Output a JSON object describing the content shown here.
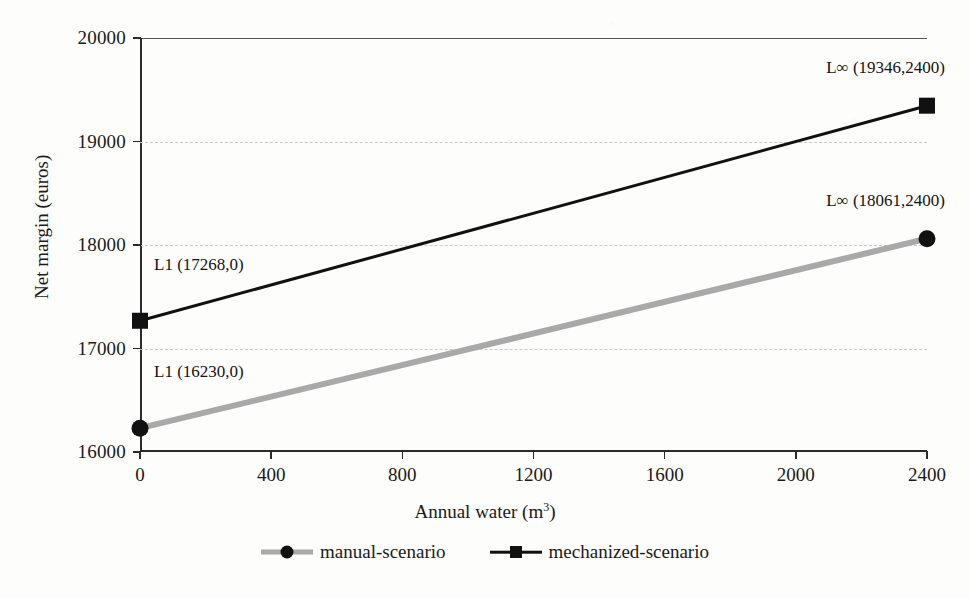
{
  "chart_data": {
    "type": "line",
    "title": "",
    "xlabel": "Annual water (m3)",
    "xlabel_base": "Annual water (m",
    "xlabel_sup": "3",
    "xlabel_tail": ")",
    "ylabel": "Net margin  (euros)",
    "xlim": [
      0,
      2400
    ],
    "ylim": [
      16000,
      20000
    ],
    "x_ticks": [
      0,
      400,
      800,
      1200,
      1600,
      2000,
      2400
    ],
    "x_tick_labels": [
      "0",
      "400",
      "800",
      "1200",
      "1600",
      "2000",
      "2400"
    ],
    "y_ticks": [
      16000,
      17000,
      18000,
      19000,
      20000
    ],
    "y_tick_labels": [
      "16000",
      "17000",
      "18000",
      "19000",
      "20000"
    ],
    "grid": true,
    "grid_style": "dashed-horizontal",
    "legend_position": "bottom-center",
    "x": [
      0,
      2400
    ],
    "series": [
      {
        "name": "manual-scenario",
        "values": [
          16230,
          18061
        ],
        "color": "#a9a9a9",
        "marker": "circle",
        "marker_color": "#111111",
        "line_width": 6
      },
      {
        "name": "mechanized-scenario",
        "values": [
          17268,
          19346
        ],
        "color": "#111111",
        "marker": "square",
        "marker_color": "#111111",
        "line_width": 3
      }
    ],
    "annotations": [
      {
        "text": "L1 (17268,0)",
        "x": 0,
        "y": 17268,
        "anchor": "above-right"
      },
      {
        "text": "L1 (16230,0)",
        "x": 0,
        "y": 16230,
        "anchor": "above-right"
      },
      {
        "text": "L∞ (19346,2400)",
        "x": 2400,
        "y": 19346,
        "anchor": "above-left"
      },
      {
        "text": "L∞ (18061,2400)",
        "x": 2400,
        "y": 18061,
        "anchor": "above-left"
      }
    ]
  },
  "legend": {
    "items": [
      {
        "label": "manual-scenario"
      },
      {
        "label": "mechanized-scenario"
      }
    ]
  },
  "colors": {
    "axis": "#2b2b2b",
    "grid": "#c9c9c9",
    "manual": "#a9a9a9",
    "mechanized": "#111111",
    "background": "#fdfdfc"
  }
}
